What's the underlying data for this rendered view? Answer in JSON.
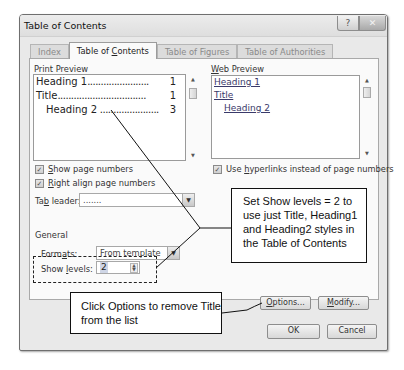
{
  "window": {
    "title": "Table of Contents",
    "help_icon": "?",
    "close_icon": "✕"
  },
  "tabs": [
    {
      "label": "Index",
      "active": false
    },
    {
      "label": "Table of Contents",
      "active": true
    },
    {
      "label": "Table of Figures",
      "active": false
    },
    {
      "label": "Table of Authorities",
      "active": false
    }
  ],
  "print_preview": {
    "label": "Print Preview",
    "lines": [
      {
        "text": "Heading 1",
        "page": "1"
      },
      {
        "text": "Title",
        "page": "1"
      },
      {
        "text": "Heading 2",
        "page": "3"
      }
    ]
  },
  "web_preview": {
    "label": "Web Preview",
    "lines": [
      "Heading 1",
      "Title",
      "Heading 2"
    ]
  },
  "options": {
    "show_page_numbers": {
      "label": "Show page numbers",
      "checked": true
    },
    "right_align": {
      "label": "Right align page numbers",
      "checked": true
    },
    "use_hyperlinks": {
      "label": "Use hyperlinks instead of page numbers",
      "checked": true
    },
    "tab_leader": {
      "label": "Tab leader:",
      "value": "......."
    }
  },
  "general": {
    "heading": "General",
    "formats_label": "Formats:",
    "formats_value": "From template",
    "show_levels_label": "Show levels:",
    "show_levels_value": "2"
  },
  "buttons": {
    "options": "Options...",
    "modify": "Modify...",
    "ok": "OK",
    "cancel": "Cancel"
  },
  "annotations": {
    "callout_levels": "Set Show levels = 2 to use just Title, Heading1 and Heading2 styles in the Table of Contents",
    "callout_options": "Click Options to remove Title from the list"
  },
  "glyphs": {
    "check": "✓",
    "drop": "▼",
    "up": "▲",
    "down": "▼"
  }
}
